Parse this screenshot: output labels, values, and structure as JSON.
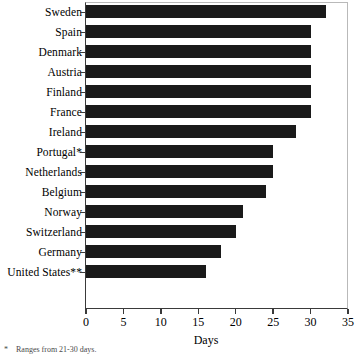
{
  "chart_data": {
    "type": "bar",
    "orientation": "horizontal",
    "title": "",
    "xlabel": "Days",
    "ylabel": "",
    "xlim": [
      0,
      35
    ],
    "xticks": [
      0,
      5,
      10,
      15,
      20,
      25,
      30,
      35
    ],
    "grid": false,
    "legend": false,
    "bar_color": "#1a1a1a",
    "categories": [
      "Sweden",
      "Spain",
      "Denmark",
      "Austria",
      "Finland",
      "France",
      "Ireland",
      "Portugal*",
      "Netherlands",
      "Belgium",
      "Norway",
      "Switzerland",
      "Germany",
      "United States**"
    ],
    "values": [
      32,
      30,
      30,
      30,
      30,
      30,
      28,
      25,
      25,
      24,
      21,
      20,
      18,
      16
    ]
  },
  "footnotes": [
    {
      "mark": "*",
      "text": "Ranges from 21-30 days."
    }
  ]
}
